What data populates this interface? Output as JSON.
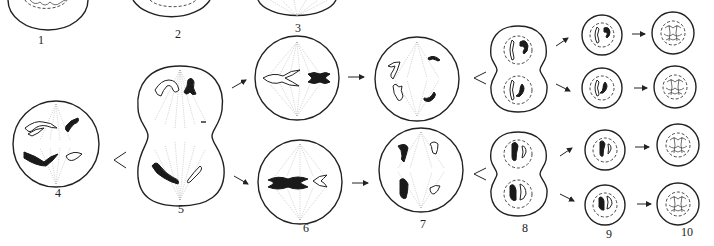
{
  "figure": {
    "stage_labels": [
      "1",
      "2",
      "3",
      "4",
      "5",
      "6",
      "7",
      "8",
      "9",
      "10"
    ]
  },
  "colors": {
    "background": "#ffffff",
    "line": "#222222",
    "chromosome_dark": "#1a1a1a",
    "chromosome_light": "#ffffff",
    "spindle": "#999999"
  }
}
